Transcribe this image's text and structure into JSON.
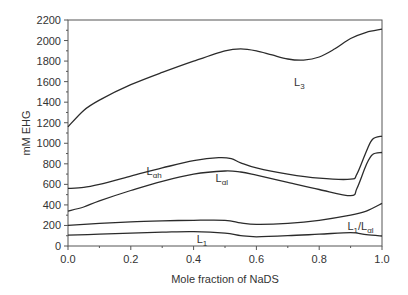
{
  "chart_data": {
    "type": "line",
    "title": "",
    "xlabel": "Mole fraction of NaDS",
    "ylabel": "mM EHG",
    "xlim": [
      0.0,
      1.0
    ],
    "ylim": [
      0,
      2200
    ],
    "grid": false,
    "legend": "none (inline curve labels)",
    "x_ticks": [
      "0.0",
      "0.2",
      "0.4",
      "0.6",
      "0.8",
      "1.0"
    ],
    "y_ticks": [
      "0",
      "200",
      "400",
      "600",
      "800",
      "1000",
      "1200",
      "1400",
      "1600",
      "1800",
      "2000",
      "2200"
    ],
    "series": [
      {
        "name": "L3 boundary",
        "x": [
          0.0,
          0.05,
          0.1,
          0.2,
          0.3,
          0.4,
          0.5,
          0.55,
          0.6,
          0.65,
          0.7,
          0.75,
          0.8,
          0.85,
          0.9,
          0.95,
          1.0
        ],
        "y": [
          1160,
          1320,
          1420,
          1570,
          1690,
          1800,
          1900,
          1920,
          1900,
          1860,
          1820,
          1810,
          1840,
          1920,
          2020,
          2080,
          2110
        ]
      },
      {
        "name": "Lαh / Lα boundary (upper)",
        "x": [
          0.0,
          0.05,
          0.1,
          0.2,
          0.3,
          0.4,
          0.48,
          0.52,
          0.55,
          0.6,
          0.7,
          0.8,
          0.9,
          0.92,
          0.95,
          0.97,
          1.0
        ],
        "y": [
          560,
          570,
          600,
          680,
          760,
          830,
          860,
          850,
          810,
          760,
          700,
          660,
          650,
          700,
          920,
          1040,
          1070
        ]
      },
      {
        "name": "Lαl boundary (lower)",
        "x": [
          0.0,
          0.05,
          0.1,
          0.2,
          0.3,
          0.4,
          0.5,
          0.55,
          0.6,
          0.7,
          0.8,
          0.9,
          0.92,
          0.95,
          0.97,
          1.0
        ],
        "y": [
          340,
          380,
          440,
          540,
          630,
          700,
          730,
          720,
          690,
          620,
          550,
          490,
          560,
          790,
          890,
          910
        ]
      },
      {
        "name": "L1/Lαl boundary",
        "x": [
          0.0,
          0.1,
          0.2,
          0.3,
          0.4,
          0.5,
          0.55,
          0.6,
          0.7,
          0.8,
          0.9,
          0.95,
          1.0
        ],
        "y": [
          200,
          220,
          235,
          245,
          250,
          250,
          225,
          210,
          220,
          250,
          300,
          340,
          415
        ]
      },
      {
        "name": "L1 boundary",
        "x": [
          0.0,
          0.1,
          0.2,
          0.3,
          0.4,
          0.5,
          0.55,
          0.6,
          0.7,
          0.8,
          0.9,
          0.95,
          1.0
        ],
        "y": [
          105,
          115,
          125,
          135,
          140,
          125,
          100,
          90,
          100,
          115,
          130,
          110,
          97
        ]
      }
    ],
    "annotations": [
      {
        "text": "L",
        "sub": "3",
        "x": 0.72,
        "y": 1560
      },
      {
        "text": "L",
        "sub": "αh",
        "x": 0.25,
        "y": 690
      },
      {
        "text": "L",
        "sub": "αl",
        "x": 0.47,
        "y": 620
      },
      {
        "text": "L",
        "sub": "1",
        "x": 0.41,
        "y": 30
      },
      {
        "text": "L",
        "sub": "1",
        "text2": "/L",
        "sub2": "αl",
        "x": 0.89,
        "y": 155
      }
    ]
  },
  "layout": {
    "plot": {
      "left": 68,
      "right": 382,
      "top": 20,
      "bottom": 246
    },
    "line_color": "#2b2b2b",
    "axis_color": "#555555"
  }
}
